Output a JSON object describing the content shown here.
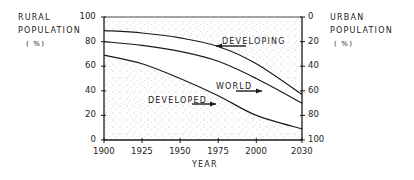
{
  "chart_data": {
    "type": "line",
    "title": "",
    "xlabel": "YEAR",
    "ylabel": "RURAL POPULATION (%)",
    "y2label": "URBAN POPULATION (%)",
    "x": [
      1900,
      1925,
      1950,
      1975,
      2000,
      2030
    ],
    "xticks": [
      "1900",
      "1925",
      "1950",
      "1975",
      "2000",
      "2030"
    ],
    "ylim": [
      0,
      100
    ],
    "yticks": [
      "0",
      "20",
      "40",
      "60",
      "80",
      "100"
    ],
    "y2lim": [
      100,
      0
    ],
    "y2ticks": [
      "0",
      "20",
      "40",
      "60",
      "80",
      "100"
    ],
    "grid": false,
    "legend": "inline annotations with arrows",
    "series": [
      {
        "name": "DEVELOPING",
        "values": [
          89,
          87,
          83,
          76,
          62,
          37
        ]
      },
      {
        "name": "WORLD",
        "values": [
          80,
          77,
          72,
          64,
          50,
          30
        ]
      },
      {
        "name": "DEVELOPED",
        "values": [
          69,
          62,
          50,
          36,
          20,
          9
        ]
      }
    ],
    "shading": "stippled area above DEVELOPING curve and below DEVELOPED curve"
  },
  "labels": {
    "left_axis_line1": "RURAL",
    "left_axis_line2": "POPULATION",
    "left_axis_unit": "( %)",
    "right_axis_line1": "URBAN",
    "right_axis_line2": "POPULATION",
    "right_axis_unit": "( %)",
    "x_axis": "YEAR",
    "developing": "DEVELOPING",
    "world": "WORLD",
    "developed": "DEVELOPED"
  },
  "colors": {
    "line": "#1a1a1a",
    "stipple": "#9a9a9a",
    "background": "#ffffff"
  }
}
